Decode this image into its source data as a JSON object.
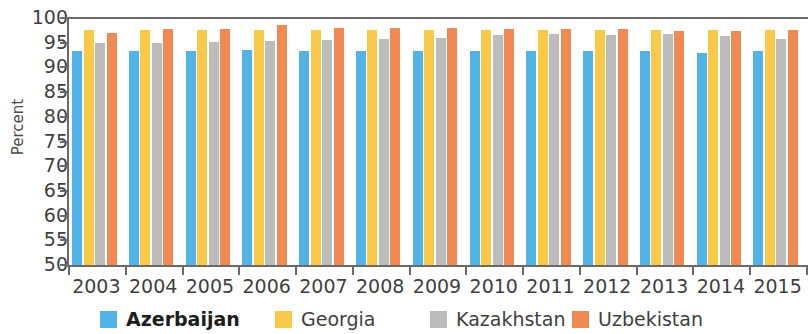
{
  "chart_data": {
    "type": "bar",
    "title": "",
    "xlabel": "",
    "ylabel": "Percent",
    "ylim": [
      50,
      100
    ],
    "ytick_step": 5,
    "yticks": [
      100,
      95,
      90,
      85,
      80,
      75,
      70,
      65,
      60,
      55,
      50
    ],
    "grid": false,
    "legend_position": "bottom",
    "categories": [
      "2003",
      "2004",
      "2005",
      "2006",
      "2007",
      "2008",
      "2009",
      "2010",
      "2011",
      "2012",
      "2013",
      "2014",
      "2015"
    ],
    "series": [
      {
        "name": "Azerbaijan",
        "color": "#51B3E6",
        "values": [
          93.4,
          93.4,
          93.4,
          93.5,
          93.4,
          93.4,
          93.4,
          93.3,
          93.3,
          93.3,
          93.3,
          93.0,
          93.3
        ]
      },
      {
        "name": "Georgia",
        "color": "#FBC948",
        "values": [
          97.6,
          97.6,
          97.5,
          97.6,
          97.6,
          97.6,
          97.5,
          97.5,
          97.6,
          97.6,
          97.6,
          97.5,
          97.6
        ]
      },
      {
        "name": "Kazakhstan",
        "color": "#BCBCBC",
        "values": [
          94.9,
          95.0,
          95.2,
          95.4,
          95.5,
          95.7,
          96.0,
          96.5,
          96.7,
          96.6,
          96.7,
          96.4,
          95.8
        ]
      },
      {
        "name": "Uzbekistan",
        "color": "#F08A52",
        "values": [
          97.0,
          97.8,
          97.8,
          98.5,
          98.0,
          98.0,
          98.0,
          97.8,
          97.8,
          97.7,
          97.4,
          97.3,
          97.6
        ]
      }
    ]
  },
  "axis": {
    "y_title": "Percent"
  },
  "legend": {
    "items": [
      {
        "label": "Azerbaijan",
        "color": "#51B3E6",
        "bold": true
      },
      {
        "label": "Georgia",
        "color": "#FBC948",
        "bold": false
      },
      {
        "label": "Kazakhstan",
        "color": "#BCBCBC",
        "bold": false
      },
      {
        "label": "Uzbekistan",
        "color": "#F08A52",
        "bold": false
      }
    ]
  }
}
